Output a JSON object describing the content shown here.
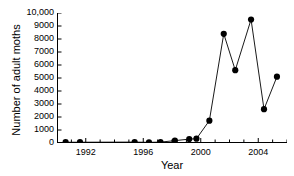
{
  "chart_data": {
    "type": "line",
    "title": "",
    "xlabel": "Year",
    "ylabel": "Number of adult moths",
    "xlim": [
      1990,
      2006
    ],
    "ylim": [
      0,
      10000
    ],
    "xtick_labels": [
      "1992",
      "1996",
      "2000",
      "2004"
    ],
    "xticks": [
      1992,
      1996,
      2000,
      2004
    ],
    "xminor_tick_interval": 1,
    "ytick_labels": [
      "0",
      "1000",
      "2000",
      "3000",
      "4000",
      "5000",
      "6000",
      "7000",
      "8000",
      "9000",
      "10,000"
    ],
    "yticks": [
      0,
      1000,
      2000,
      3000,
      4000,
      5000,
      6000,
      7000,
      8000,
      9000,
      10000
    ],
    "grid": false,
    "legend": false,
    "marker": "filled-circle",
    "marker_color": "#000000",
    "line_color": "#000000",
    "x": [
      1990.6,
      1991.6,
      1995.4,
      1996.4,
      1997.2,
      1998.2,
      1999.2,
      1999.7,
      2000.6,
      2001.6,
      2002.4,
      2003.5,
      2004.4,
      2005.3
    ],
    "values": [
      60,
      60,
      70,
      50,
      70,
      180,
      300,
      330,
      1720,
      8400,
      5600,
      9500,
      2600,
      5100
    ],
    "series": [
      {
        "name": "Number of adult moths",
        "values": [
          60,
          60,
          70,
          50,
          70,
          180,
          300,
          330,
          1720,
          8400,
          5600,
          9500,
          2600,
          5100
        ]
      }
    ]
  }
}
